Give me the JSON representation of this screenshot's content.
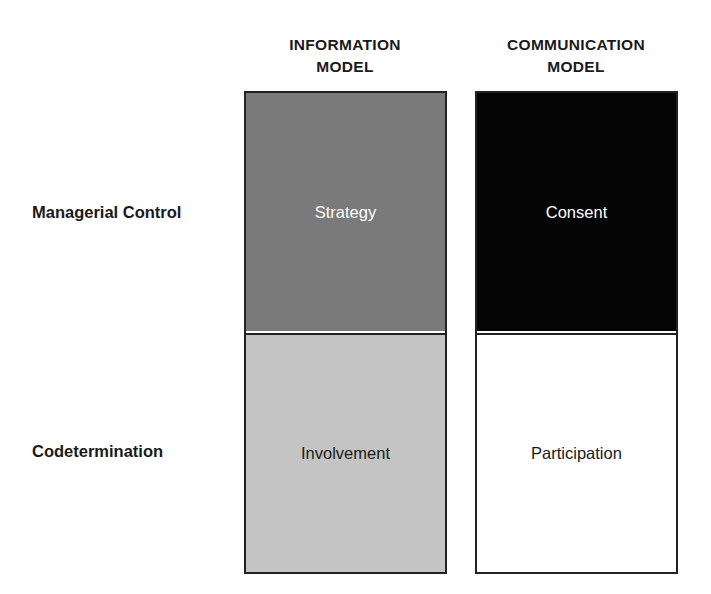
{
  "columns": [
    {
      "header_line1": "INFORMATION",
      "header_line2": "MODEL",
      "cells": [
        {
          "label": "Strategy",
          "fill": "#7a7a7a",
          "text_color": "#ffffff"
        },
        {
          "label": "Involvement",
          "fill": "#c4c4c4",
          "text_color": "#1a1a1a"
        }
      ]
    },
    {
      "header_line1": "COMMUNICATION",
      "header_line2": "MODEL",
      "cells": [
        {
          "label": "Consent",
          "fill": "#050505",
          "text_color": "#ffffff"
        },
        {
          "label": "Participation",
          "fill": "#ffffff",
          "text_color": "#1a1a1a"
        }
      ]
    }
  ],
  "rows": [
    {
      "label": "Managerial Control"
    },
    {
      "label": "Codetermination"
    }
  ]
}
